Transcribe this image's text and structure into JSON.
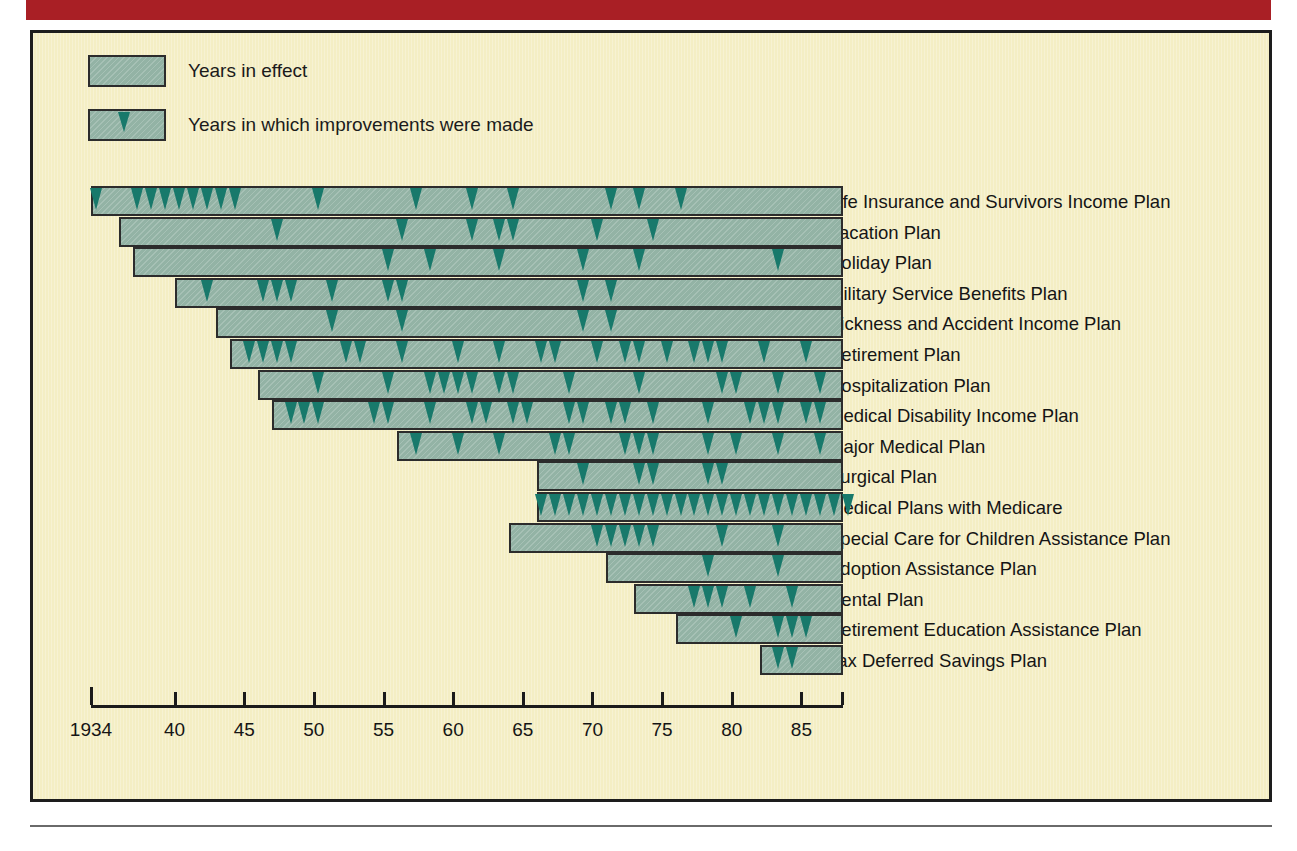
{
  "page": {
    "accent_red": "#a91f25",
    "figure_background": "#f4eec4",
    "bar_fill": "#93b3a5",
    "bar_border": "#2c2c2c",
    "arrow_color": "#18796b",
    "text_color": "#151515"
  },
  "legend": {
    "items": [
      {
        "label": "Years in effect",
        "has_arrow": false
      },
      {
        "label": "Years in which improvements were made",
        "has_arrow": true
      }
    ]
  },
  "axis": {
    "start_year": 1934,
    "end_year": 1988,
    "tick_labels": [
      "1934",
      "40",
      "45",
      "50",
      "55",
      "60",
      "65",
      "70",
      "75",
      "80",
      "85"
    ],
    "tick_years": [
      1934,
      1940,
      1945,
      1950,
      1955,
      1960,
      1965,
      1970,
      1975,
      1980,
      1985
    ]
  },
  "chart_data": {
    "type": "bar",
    "xlabel": "",
    "ylabel": "",
    "xlim": [
      1934,
      1988
    ],
    "grid": false,
    "legend": [
      "Years in effect",
      "Years in which improvements were made"
    ],
    "legend_position": "top-left",
    "orientation": "horizontal",
    "categories": [
      "Life Insurance and Survivors Income Plan",
      "Vacation Plan",
      "Holiday Plan",
      "Military Service Benefits Plan",
      "Sickness and Accident Income Plan",
      "Retirement Plan",
      "Hospitalization Plan",
      "Medical Disability Income Plan",
      "Major Medical Plan",
      "Surgical Plan",
      "Medical Plans with Medicare",
      "Special Care for Children Assistance Plan",
      "Adoption Assistance Plan",
      "Dental Plan",
      "Retirement Education Assistance Plan",
      "Tax Deferred Savings Plan"
    ],
    "series": [
      {
        "name": "Life Insurance and Survivors Income Plan",
        "start_year": 1934,
        "end_year": 1988,
        "improvement_years": [
          1934,
          1937,
          1938,
          1939,
          1940,
          1941,
          1942,
          1943,
          1944,
          1950,
          1957,
          1961,
          1964,
          1971,
          1973,
          1976
        ]
      },
      {
        "name": "Vacation Plan",
        "start_year": 1936,
        "end_year": 1988,
        "improvement_years": [
          1947,
          1956,
          1961,
          1963,
          1964,
          1970,
          1974
        ]
      },
      {
        "name": "Holiday Plan",
        "start_year": 1937,
        "end_year": 1988,
        "improvement_years": [
          1955,
          1958,
          1963,
          1969,
          1973,
          1983
        ]
      },
      {
        "name": "Military Service Benefits Plan",
        "start_year": 1940,
        "end_year": 1988,
        "improvement_years": [
          1942,
          1946,
          1947,
          1948,
          1951,
          1955,
          1956,
          1969,
          1971
        ]
      },
      {
        "name": "Sickness and Accident Income Plan",
        "start_year": 1943,
        "end_year": 1988,
        "improvement_years": [
          1951,
          1956,
          1969,
          1971
        ]
      },
      {
        "name": "Retirement Plan",
        "start_year": 1944,
        "end_year": 1988,
        "improvement_years": [
          1945,
          1946,
          1947,
          1948,
          1952,
          1953,
          1956,
          1960,
          1963,
          1966,
          1967,
          1970,
          1972,
          1973,
          1975,
          1977,
          1978,
          1979,
          1982,
          1985
        ]
      },
      {
        "name": "Hospitalization Plan",
        "start_year": 1946,
        "end_year": 1988,
        "improvement_years": [
          1950,
          1955,
          1958,
          1959,
          1960,
          1961,
          1963,
          1964,
          1968,
          1973,
          1979,
          1980,
          1983,
          1986
        ]
      },
      {
        "name": "Medical Disability Income Plan",
        "start_year": 1947,
        "end_year": 1988,
        "improvement_years": [
          1948,
          1949,
          1950,
          1954,
          1955,
          1958,
          1961,
          1962,
          1964,
          1965,
          1968,
          1969,
          1971,
          1972,
          1974,
          1978,
          1981,
          1982,
          1983,
          1985,
          1986
        ]
      },
      {
        "name": "Major Medical Plan",
        "start_year": 1956,
        "end_year": 1988,
        "improvement_years": [
          1957,
          1960,
          1963,
          1967,
          1968,
          1972,
          1973,
          1974,
          1978,
          1980,
          1983,
          1986
        ]
      },
      {
        "name": "Surgical Plan",
        "start_year": 1966,
        "end_year": 1988,
        "improvement_years": [
          1969,
          1973,
          1974,
          1978,
          1979
        ]
      },
      {
        "name": "Medical Plans with Medicare",
        "start_year": 1966,
        "end_year": 1988,
        "improvement_years": [
          1966,
          1967,
          1968,
          1969,
          1970,
          1971,
          1972,
          1973,
          1974,
          1975,
          1976,
          1977,
          1978,
          1979,
          1980,
          1981,
          1982,
          1983,
          1984,
          1985,
          1986,
          1987,
          1988
        ]
      },
      {
        "name": "Special Care for Children Assistance Plan",
        "start_year": 1964,
        "end_year": 1988,
        "improvement_years": [
          1970,
          1971,
          1972,
          1973,
          1974,
          1979,
          1983
        ]
      },
      {
        "name": "Adoption Assistance Plan",
        "start_year": 1971,
        "end_year": 1988,
        "improvement_years": [
          1978,
          1983
        ]
      },
      {
        "name": "Dental Plan",
        "start_year": 1973,
        "end_year": 1988,
        "improvement_years": [
          1977,
          1978,
          1979,
          1981,
          1984
        ]
      },
      {
        "name": "Retirement Education Assistance Plan",
        "start_year": 1976,
        "end_year": 1988,
        "improvement_years": [
          1980,
          1983,
          1984,
          1985
        ]
      },
      {
        "name": "Tax Deferred Savings Plan",
        "start_year": 1982,
        "end_year": 1988,
        "improvement_years": [
          1983,
          1984
        ]
      }
    ]
  },
  "page_text": {
    "top": "an unpaid leave of absence for up to twelve months; and dependent care\nfor employees with ill or aged relatives.",
    "right": "Employee Assistance Counseling and other services are also\noffered employees and their immediate family, with insurance to cover part\n\nof the cost of treatment and referral.\n\nThe Company provides flexible benefits in the form of a cafeteria\nplan, under which employees select from a menu of benefit options\nwhose total value is fixed, enabling workers to tailor coverage to\ntheir needs.\n\nThe work force today is more varied than ever before, as women\nand minorities make up an increasing share of employment, and more\nworkers hold jobs in the service sector than in manufacturing.\nCorporations have responded with programs that reach beyond the\ntraditional wage and salary package, addressing child care, elder\ncare, education, health promotion, and retirement planning.\n\nA significant number of firms now offer assistance with adoption,\nand some have opened on-site day care centers. Others underwrite\ntuition for dependents or reimburse expenses for job-related study.\n\nSurveys indicate that such benefits improve morale, reduce\nabsenteeism, and help attract qualified applicants in a competitive\nlabor market."
  }
}
